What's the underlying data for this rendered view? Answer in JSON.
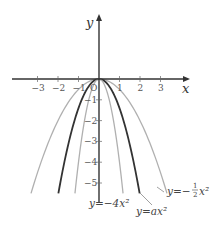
{
  "chart_data": {
    "type": "line",
    "title": "",
    "xlabel": "x",
    "ylabel": "y",
    "xlim": [
      -3.9,
      3.9
    ],
    "ylim": [
      -5.9,
      3.7
    ],
    "grid": false,
    "x_ticks": [
      -3,
      -2,
      -1,
      0,
      1,
      2,
      3
    ],
    "x_tick_labels": [
      "−3",
      "−2",
      "−1",
      "O",
      "1",
      "2",
      "3"
    ],
    "y_ticks": [
      -1,
      -2,
      -3,
      -4,
      -5
    ],
    "y_tick_labels": [
      "−1",
      "−2",
      "−3",
      "−4",
      "−5"
    ],
    "series": [
      {
        "name": "y = −1/2 x²",
        "a": -0.5,
        "color": "#b0b0b0",
        "width": 1.3,
        "y_min": -5.5
      },
      {
        "name": "y = ax²",
        "a": -1.4,
        "color": "#333333",
        "width": 1.8,
        "y_min": -5.5
      },
      {
        "name": "y = −4x²",
        "a": -4,
        "color": "#b0b0b0",
        "width": 1.3,
        "y_min": -5.5
      }
    ],
    "annotations": [
      {
        "text": "y = −4x²",
        "position": "below origin"
      },
      {
        "text": "y = ax²",
        "position": "below right, leader line to dark curve"
      },
      {
        "text": "y = −½ x²",
        "position": "right, leader line to outer curve"
      }
    ]
  },
  "labels": {
    "x_axis": "x",
    "y_axis": "y",
    "origin": "O",
    "eq_minus4": "y=−4x²",
    "eq_a": "y=ax²",
    "eq_half_prefix": "y=−",
    "eq_half_num": "1",
    "eq_half_den": "2",
    "eq_half_suffix": "x²"
  }
}
